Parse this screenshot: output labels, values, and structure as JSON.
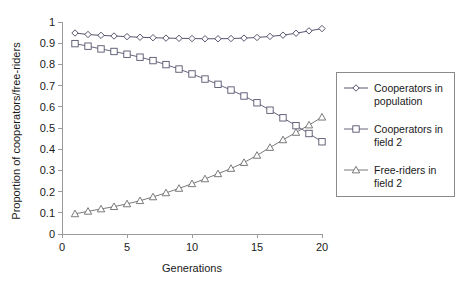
{
  "chart_data": {
    "type": "line",
    "title": "",
    "xlabel": "Generations",
    "ylabel": "Proportion of cooperators/free-riders",
    "xlim": [
      0,
      20
    ],
    "ylim": [
      0,
      1
    ],
    "xticks": [
      0,
      5,
      10,
      15,
      20
    ],
    "xtick_labels": [
      "0",
      "5",
      "10",
      "15",
      "20"
    ],
    "yticks": [
      0,
      0.1,
      0.2,
      0.3,
      0.4,
      0.5,
      0.6,
      0.7,
      0.8,
      0.9,
      1
    ],
    "ytick_labels": [
      "0",
      "0.1",
      "0.2",
      "0.3",
      "0.4",
      "0.5",
      "0.6",
      "0.7",
      "0.8",
      "0.9",
      "1"
    ],
    "grid": false,
    "legend_position": "right",
    "x": [
      1,
      2,
      3,
      4,
      5,
      6,
      7,
      8,
      9,
      10,
      11,
      12,
      13,
      14,
      15,
      16,
      17,
      18,
      19,
      20
    ],
    "series": [
      {
        "name": "Cooperators in population",
        "marker": "diamond",
        "color": "#43435f",
        "values": [
          0.948,
          0.941,
          0.937,
          0.934,
          0.931,
          0.928,
          0.926,
          0.924,
          0.923,
          0.922,
          0.921,
          0.921,
          0.922,
          0.924,
          0.927,
          0.932,
          0.938,
          0.947,
          0.958,
          0.969
        ]
      },
      {
        "name": "Cooperators in field 2",
        "marker": "square",
        "color": "#55556e",
        "values": [
          0.898,
          0.886,
          0.873,
          0.861,
          0.848,
          0.834,
          0.818,
          0.799,
          0.778,
          0.755,
          0.731,
          0.706,
          0.679,
          0.651,
          0.619,
          0.584,
          0.548,
          0.511,
          0.474,
          0.435
        ]
      },
      {
        "name": "Free-riders in field 2",
        "marker": "triangle",
        "color": "#6b6b6b",
        "values": [
          0.095,
          0.107,
          0.118,
          0.129,
          0.142,
          0.157,
          0.175,
          0.194,
          0.215,
          0.237,
          0.26,
          0.284,
          0.309,
          0.337,
          0.371,
          0.408,
          0.444,
          0.479,
          0.514,
          0.551
        ]
      }
    ]
  },
  "legend": {
    "entries": [
      {
        "label_line1": "Cooperators in",
        "label_line2": "population"
      },
      {
        "label_line1": "Cooperators in",
        "label_line2": "field 2"
      },
      {
        "label_line1": "Free-riders in",
        "label_line2": "field 2"
      }
    ]
  },
  "colors": {
    "axis": "#9a9a9a",
    "text": "#1a1a1a",
    "background": "#ffffff",
    "legend_border": "#8a8a8a"
  }
}
